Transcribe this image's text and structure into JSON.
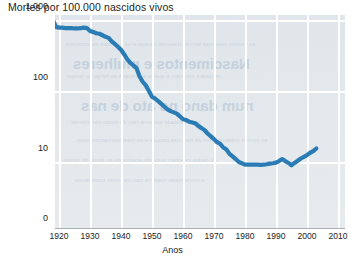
{
  "chart_data": {
    "type": "line",
    "title": "Mortes por 100.000 nascidos vivos",
    "xlabel": "Anos",
    "ylabel": "",
    "yscale": "log",
    "grid": true,
    "legend": null,
    "xlim": [
      1915,
      2013
    ],
    "ylim": [
      1,
      1000
    ],
    "ytick_labels": [
      "1.000",
      "100",
      "10",
      "0"
    ],
    "ytick_values": [
      1000,
      100,
      10,
      0
    ],
    "xtick_labels": [
      "1920",
      "1930",
      "1940",
      "1950",
      "1960",
      "1970",
      "1980",
      "1990",
      "2000",
      "2010"
    ],
    "xtick_values": [
      1920,
      1930,
      1940,
      1950,
      1960,
      1970,
      1980,
      1990,
      2000,
      2010
    ],
    "line_color": "#2b7cb5",
    "plot_background": "#e2e7eb",
    "gridline_color": "#ffffff",
    "series": [
      {
        "name": "Mortalidade materna",
        "x": [
          1915,
          1916,
          1917,
          1918,
          1919,
          1920,
          1921,
          1922,
          1923,
          1924,
          1925,
          1926,
          1927,
          1928,
          1929,
          1930,
          1931,
          1932,
          1933,
          1934,
          1935,
          1936,
          1937,
          1938,
          1939,
          1940,
          1941,
          1942,
          1943,
          1944,
          1945,
          1946,
          1947,
          1948,
          1949,
          1950,
          1951,
          1952,
          1953,
          1954,
          1955,
          1956,
          1957,
          1958,
          1959,
          1960,
          1961,
          1962,
          1963,
          1964,
          1965,
          1966,
          1967,
          1968,
          1969,
          1970,
          1971,
          1972,
          1973,
          1974,
          1975,
          1976,
          1977,
          1978,
          1979,
          1980,
          1981,
          1982,
          1983,
          1984,
          1985,
          1986,
          1987,
          1988,
          1989,
          1990,
          1991,
          1992,
          1993,
          1994,
          1995,
          1996,
          1997,
          1998,
          1999,
          2000,
          2001,
          2002,
          2003
        ],
        "y": [
          980,
          880,
          830,
          1010,
          800,
          780,
          780,
          770,
          770,
          770,
          760,
          760,
          770,
          780,
          770,
          700,
          680,
          650,
          640,
          610,
          580,
          560,
          500,
          460,
          420,
          380,
          330,
          280,
          250,
          230,
          210,
          160,
          135,
          120,
          100,
          83,
          78,
          72,
          66,
          60,
          55,
          52,
          50,
          48,
          44,
          40,
          39,
          37,
          36,
          35,
          32,
          30,
          28,
          25,
          23,
          21,
          19,
          18,
          16,
          15,
          13,
          12,
          11,
          10,
          9.6,
          9.2,
          9.2,
          9.2,
          9.2,
          9.2,
          9.1,
          9.2,
          9.3,
          9.5,
          9.6,
          9.8,
          10.3,
          11.0,
          10.3,
          9.7,
          9.0,
          9.7,
          10.4,
          11.2,
          11.8,
          12.5,
          13.5,
          14.2,
          15.5
        ]
      }
    ],
    "annotations": []
  },
  "watermark": {
    "heading_line1": "Nascimentos e mulheres",
    "heading_line2": "num dano no ato de nas",
    "body_line1": "as mortes maternas tem as mesmas causas e os mesmos nascimentos",
    "body_line2": "os dados mostram a queda acentuada ao longo do tempo",
    "body_line3": "a mortalidade materna caiu de modo consistente"
  }
}
